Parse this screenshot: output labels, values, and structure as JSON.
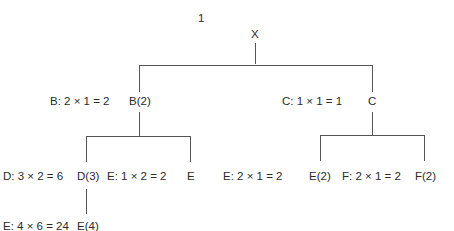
{
  "diagram": {
    "step_label": "1",
    "nodes": {
      "root": {
        "label": "X"
      },
      "b": {
        "label": "B(2)",
        "calc": "B: 2 × 1 = 2"
      },
      "c": {
        "label": "C",
        "calc": "C: 1 × 1 = 1"
      },
      "d": {
        "label": "D(3)",
        "calc": "D: 3 × 2 = 6"
      },
      "e_under_b": {
        "label": "E",
        "calc": "E: 1 × 2 = 2"
      },
      "e_under_c": {
        "label": "E(2)",
        "calc": "E: 2 × 1 = 2"
      },
      "f": {
        "label": "F(2)",
        "calc": "F: 2 × 1 = 2"
      },
      "e_under_d": {
        "label": "E(4)",
        "calc": "E: 4 × 6 = 24"
      }
    },
    "edges": [
      [
        "X",
        "B(2)"
      ],
      [
        "X",
        "C"
      ],
      [
        "B(2)",
        "D(3)"
      ],
      [
        "B(2)",
        "E"
      ],
      [
        "C",
        "E(2)"
      ],
      [
        "C",
        "F(2)"
      ],
      [
        "D(3)",
        "E(4)"
      ]
    ]
  }
}
